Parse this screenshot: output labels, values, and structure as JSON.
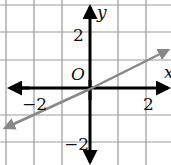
{
  "graph": {
    "x_axis_label": "x",
    "y_axis_label": "y",
    "origin_label": "O",
    "x_tick_labels": [
      "−2",
      "2"
    ],
    "y_tick_labels": [
      "2",
      "−2"
    ],
    "grid_spacing_units": 1,
    "x_range": [
      -3,
      3
    ],
    "y_range": [
      -3,
      3
    ],
    "line": {
      "equation": "y = x/2",
      "slope": 0.5,
      "intercept": 0,
      "color": "#888888"
    },
    "axis_color": "#000000",
    "grid_color": "#999999"
  }
}
